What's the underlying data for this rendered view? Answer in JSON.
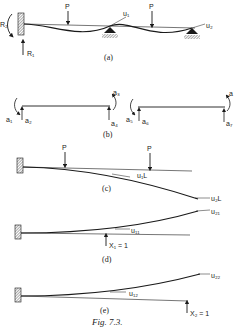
{
  "figure": {
    "title": "Fig. 7.3.",
    "colors": {
      "ink": "#1a1a1a",
      "background": "#ffffff",
      "hatch": "#555555"
    }
  },
  "panel_a": {
    "caption": "(a)",
    "loads": [
      "P",
      "P"
    ],
    "reactions": [
      "R₂",
      "R₁"
    ],
    "rotations": [
      "u₁",
      "u₂"
    ]
  },
  "panel_b": {
    "caption": "(b)",
    "span1_labels": [
      "a₁",
      "a₂",
      "a₃",
      "a₄"
    ],
    "span2_labels": [
      "a₅",
      "a₆",
      "a",
      "a₇"
    ]
  },
  "panel_c": {
    "caption": "(c)",
    "loads": [
      "P",
      "P"
    ],
    "rotations": [
      "u₁L",
      "u₂L"
    ]
  },
  "panel_d": {
    "caption": "(d)",
    "rotations": [
      "u₁₁",
      "u₂₁"
    ],
    "unit_load": "X₁ = 1"
  },
  "panel_e": {
    "caption": "(e)",
    "rotations": [
      "u₁₂",
      "u₂₂"
    ],
    "unit_load": "X₂ = 1"
  }
}
